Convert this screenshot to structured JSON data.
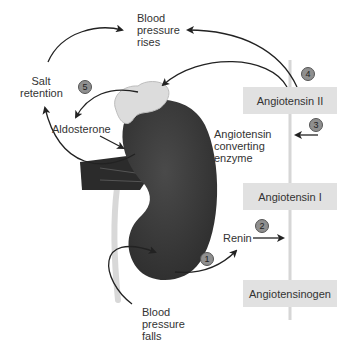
{
  "diagram": {
    "nodes": {
      "bp_rises": [
        "Blood",
        "pressure",
        "rises"
      ],
      "bp_falls": [
        "Blood",
        "pressure",
        "falls"
      ],
      "salt_retention": [
        "Salt",
        "retention"
      ],
      "aldosterone": "Aldosterone",
      "ace": [
        "Angiotensin",
        "converting",
        "enzyme"
      ],
      "renin": "Renin",
      "angiotensin_ii": "Angiotensin II",
      "angiotensin_i": "Angiotensin I",
      "angiotensinogen": "Angiotensinogen"
    },
    "steps": [
      "1",
      "2",
      "3",
      "4",
      "5"
    ],
    "colors": {
      "box_fill": "#e1e1e1",
      "kidney": "#3a3a3a",
      "adrenal": "#dcdcdc",
      "badge": "#8f8f8f",
      "arrow": "#222222",
      "ureter": "#d8d8d8",
      "axis_line": "#d6d6d6"
    }
  }
}
